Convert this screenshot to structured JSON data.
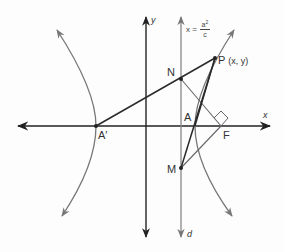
{
  "diagram": {
    "colors": {
      "axis": "#222222",
      "curve": "#777777",
      "directrix": "#888888",
      "segment": "#2a2a2a",
      "light_segment": "#666666",
      "background": "#fdfdfd"
    },
    "labels": {
      "x_axis": "x",
      "y_axis": "y",
      "directrix_name": "d",
      "directrix_eq_lhs": "x =",
      "directrix_eq_num": "a",
      "directrix_eq_sup": "2",
      "directrix_eq_den": "c",
      "point_P": "P",
      "point_P_coords": "(x, y)",
      "point_N": "N",
      "point_A": "A",
      "point_A_prime": "A′",
      "point_F": "F",
      "point_M": "M"
    },
    "points": {
      "A_prime": [
        96,
        126
      ],
      "A": [
        195,
        126
      ],
      "F": [
        221,
        126
      ],
      "N": [
        181,
        79
      ],
      "P": [
        215,
        58
      ],
      "M": [
        181,
        168
      ]
    },
    "elements": [
      "x-axis with arrows both directions",
      "y-axis with arrows both directions",
      "directrix d: x = a^2/c (vertical line with arrows)",
      "left hyperbola branch through A'",
      "right hyperbola branch through A",
      "segment A'P through N",
      "segment NF",
      "segment MF",
      "segments AP and MP",
      "right-angle marker at F",
      "ray from A through P extended"
    ]
  }
}
